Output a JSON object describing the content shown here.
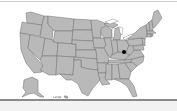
{
  "map": {
    "region": "United States",
    "fill_color": "#b9b9b9",
    "border_color": "#6f6f6f",
    "background": "#ffffff",
    "marker": {
      "label": "location-marker",
      "color": "#000000",
      "x": 124,
      "y": 52
    },
    "scale_label": "Large"
  }
}
